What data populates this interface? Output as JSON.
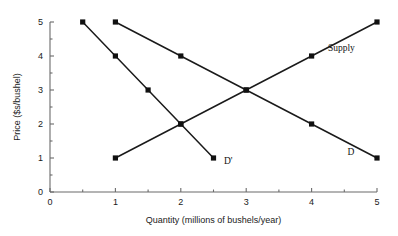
{
  "chart_data": {
    "type": "line",
    "title": "",
    "xlabel": "Quantity (millions of bushels/year)",
    "ylabel": "Price ($s/bushel)",
    "xlim": [
      0,
      5
    ],
    "ylim": [
      0,
      5
    ],
    "xticks": [
      0,
      1,
      2,
      3,
      4,
      5
    ],
    "yticks": [
      0,
      1,
      2,
      3,
      4,
      5
    ],
    "xtick_labels": [
      "0",
      "1",
      "2",
      "3",
      "4",
      "5"
    ],
    "ytick_labels": [
      "0",
      "1",
      "2",
      "3",
      "4",
      "5"
    ],
    "minor_xticks": [
      0.5,
      1.5,
      2.5,
      3.5,
      4.5
    ],
    "minor_yticks": [
      0.5,
      1.5,
      2.5,
      3.5,
      4.5
    ],
    "grid": false,
    "legend_position": "inline-annotations",
    "marker": "square",
    "marker_color": "#111111",
    "line_color": "#1a1a1a",
    "axis_color": "#6b6b6b",
    "series": [
      {
        "name": "Supply",
        "label": "Supply",
        "label_x": 4.25,
        "label_y": 4.25,
        "x": [
          1,
          2,
          3,
          4,
          5
        ],
        "y": [
          1,
          2,
          3,
          4,
          5
        ]
      },
      {
        "name": "D",
        "label": "D",
        "label_x": 4.55,
        "label_y": 1.18,
        "x": [
          1,
          2,
          3,
          4,
          5
        ],
        "y": [
          5,
          4,
          3,
          2,
          1
        ]
      },
      {
        "name": "D'",
        "label": "D'",
        "label_x": 2.66,
        "label_y": 0.92,
        "x": [
          0.5,
          1,
          1.5,
          2,
          2.5
        ],
        "y": [
          5,
          4,
          3,
          2,
          1
        ]
      }
    ],
    "annotations": [
      {
        "text": "Supply",
        "x": 4.25,
        "y": 4.25
      },
      {
        "text": "D",
        "x": 4.55,
        "y": 1.18
      },
      {
        "text": "D'",
        "x": 2.66,
        "y": 0.92
      }
    ],
    "equilibrium": {
      "x": 3,
      "y": 3
    }
  }
}
